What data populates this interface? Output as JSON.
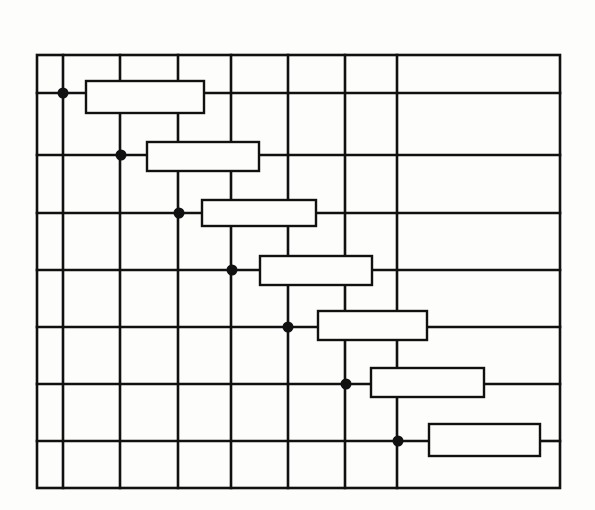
{
  "diagram": {
    "type": "resistor-grid-circuit",
    "stroke_color": "#111111",
    "background_color": "#fdfdfb",
    "frame": {
      "x1": 37,
      "y1": 55,
      "x2": 560,
      "y2": 488
    },
    "vertical_lines_x": [
      63,
      120,
      178,
      231,
      288,
      345,
      397
    ],
    "rows": [
      {
        "y": 93,
        "dot_x": 63,
        "resistor": {
          "x": 86,
          "y": 81,
          "w": 118,
          "h": 32
        }
      },
      {
        "y": 155,
        "dot_x": 121,
        "resistor": {
          "x": 147,
          "y": 142,
          "w": 112,
          "h": 29
        }
      },
      {
        "y": 213,
        "dot_x": 179,
        "resistor": {
          "x": 202,
          "y": 200,
          "w": 114,
          "h": 26
        }
      },
      {
        "y": 270,
        "dot_x": 232,
        "resistor": {
          "x": 260,
          "y": 256,
          "w": 112,
          "h": 29
        }
      },
      {
        "y": 327,
        "dot_x": 288,
        "resistor": {
          "x": 318,
          "y": 311,
          "w": 109,
          "h": 29
        }
      },
      {
        "y": 384,
        "dot_x": 346,
        "resistor": {
          "x": 371,
          "y": 368,
          "w": 113,
          "h": 29
        }
      },
      {
        "y": 441,
        "dot_x": 398,
        "resistor": {
          "x": 429,
          "y": 424,
          "w": 111,
          "h": 32
        }
      }
    ]
  }
}
